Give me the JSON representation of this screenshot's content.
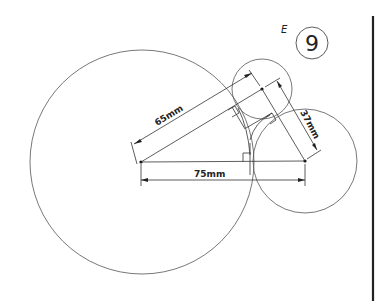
{
  "drawing": {
    "title_letter": "E",
    "problem_number": "9",
    "dimensions": {
      "center_to_center_horizontal": "75mm",
      "large_to_small": "65mm",
      "small_to_right": "37mm"
    },
    "circles": [
      {
        "name": "large-circle",
        "cx": 142,
        "cy": 162,
        "r": 112
      },
      {
        "name": "small-circle",
        "cx": 262,
        "cy": 89,
        "r": 30
      },
      {
        "name": "right-circle",
        "cx": 305,
        "cy": 161,
        "r": 52
      }
    ],
    "line_color": "#333333",
    "border_line_color": "#222222"
  }
}
